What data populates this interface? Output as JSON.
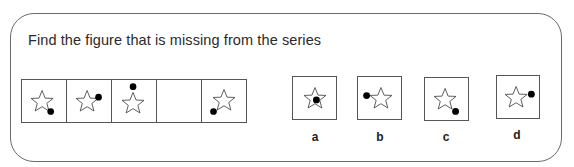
{
  "question": {
    "title": "Find the figure that is missing from the series"
  },
  "series": {
    "cells": [
      {
        "shape": "star",
        "dot": "bottom-right",
        "missing": false
      },
      {
        "shape": "star",
        "dot": "right",
        "missing": false
      },
      {
        "shape": "star",
        "dot": "top",
        "missing": false
      },
      {
        "shape": "none",
        "dot": "none",
        "missing": true
      },
      {
        "shape": "star",
        "dot": "bottom-left",
        "missing": false
      }
    ]
  },
  "options": [
    {
      "label": "a",
      "shape": "star",
      "dot": "center"
    },
    {
      "label": "b",
      "shape": "star",
      "dot": "left"
    },
    {
      "label": "c",
      "shape": "star",
      "dot": "bottom-right"
    },
    {
      "label": "d",
      "shape": "star",
      "dot": "right"
    }
  ],
  "colors": {
    "border": "#555555",
    "dot": "#000000",
    "text": "#2a2a2a"
  }
}
